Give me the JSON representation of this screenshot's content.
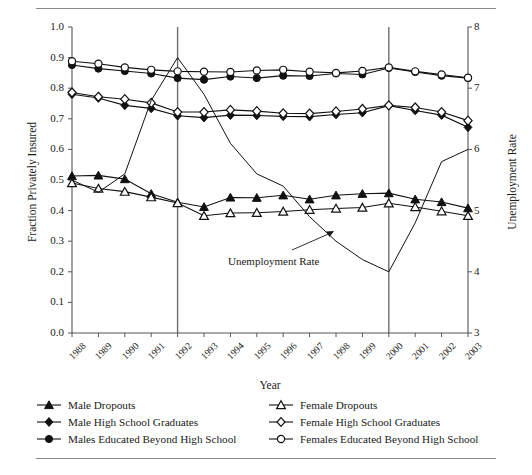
{
  "chart_data": {
    "type": "line",
    "title": "",
    "xlabel": "Year",
    "ylabel": "Fraction Privately Insured",
    "y2label": "Unemployment Rate",
    "grid": false,
    "legend_position": "bottom",
    "ylim": [
      0.0,
      1.0
    ],
    "y2lim": [
      3,
      8
    ],
    "x": [
      "1988",
      "1989",
      "1990",
      "1991",
      "1992",
      "1993",
      "1994",
      "1995",
      "1996",
      "1997",
      "1998",
      "1999",
      "2000",
      "2001",
      "2002",
      "2003"
    ],
    "yticks": [
      "0.0",
      "0.1",
      "0.2",
      "0.3",
      "0.4",
      "0.5",
      "0.6",
      "0.7",
      "0.8",
      "0.9",
      "1.0"
    ],
    "y2ticks": [
      "3",
      "4",
      "5",
      "6",
      "7",
      "8"
    ],
    "vlines": [
      "1992",
      "2000"
    ],
    "annotations": [
      {
        "text": "Unemployment Rate",
        "x": "1996",
        "y": 0.22
      }
    ],
    "series": [
      {
        "name": "Male Dropouts",
        "marker": "filled-triangle",
        "axis": "left",
        "values": [
          0.513,
          0.515,
          0.503,
          0.455,
          0.427,
          0.412,
          0.443,
          0.442,
          0.45,
          0.437,
          0.45,
          0.455,
          0.457,
          0.437,
          0.428,
          0.408
        ]
      },
      {
        "name": "Female Dropouts",
        "marker": "open-triangle",
        "axis": "left",
        "values": [
          0.49,
          0.472,
          0.462,
          0.444,
          0.425,
          0.383,
          0.392,
          0.393,
          0.397,
          0.403,
          0.407,
          0.41,
          0.424,
          0.412,
          0.398,
          0.383
        ]
      },
      {
        "name": "Male High School Graduates",
        "marker": "filled-diamond",
        "axis": "left",
        "values": [
          0.78,
          0.768,
          0.744,
          0.734,
          0.71,
          0.704,
          0.712,
          0.711,
          0.708,
          0.707,
          0.714,
          0.72,
          0.743,
          0.727,
          0.712,
          0.672
        ]
      },
      {
        "name": "Female High School Graduates",
        "marker": "open-diamond",
        "axis": "left",
        "values": [
          0.786,
          0.772,
          0.764,
          0.752,
          0.722,
          0.722,
          0.729,
          0.725,
          0.718,
          0.717,
          0.724,
          0.732,
          0.744,
          0.737,
          0.722,
          0.694
        ]
      },
      {
        "name": "Males Educated Beyond High School",
        "marker": "filled-circle",
        "axis": "left",
        "values": [
          0.876,
          0.864,
          0.856,
          0.848,
          0.833,
          0.828,
          0.838,
          0.833,
          0.841,
          0.84,
          0.848,
          0.845,
          0.866,
          0.853,
          0.841,
          0.833
        ]
      },
      {
        "name": "Females Educated Beyond High School",
        "marker": "open-circle",
        "axis": "left",
        "values": [
          0.888,
          0.88,
          0.868,
          0.86,
          0.855,
          0.854,
          0.853,
          0.858,
          0.86,
          0.854,
          0.85,
          0.856,
          0.868,
          0.855,
          0.845,
          0.834
        ]
      },
      {
        "name": "Unemployment Rate",
        "marker": "none",
        "axis": "right",
        "values": [
          5.5,
          5.3,
          5.6,
          6.8,
          7.5,
          6.9,
          6.1,
          5.6,
          5.4,
          4.9,
          4.5,
          4.2,
          4.0,
          4.8,
          5.8,
          6.0
        ]
      }
    ]
  },
  "legend": {
    "column_left": [
      {
        "label": "Male Dropouts",
        "marker": "filled-triangle"
      },
      {
        "label": "Male High School Graduates",
        "marker": "filled-diamond"
      },
      {
        "label": "Males Educated Beyond High School",
        "marker": "filled-circle"
      }
    ],
    "column_right": [
      {
        "label": "Female Dropouts",
        "marker": "open-triangle"
      },
      {
        "label": "Female High School Graduates",
        "marker": "open-diamond"
      },
      {
        "label": "Females Educated Beyond High School",
        "marker": "open-circle"
      }
    ]
  },
  "colors": {
    "ink": "#1a1a1a",
    "rule": "#8a8a8a",
    "vline": "#6e6e6e",
    "axis": "#555555"
  }
}
